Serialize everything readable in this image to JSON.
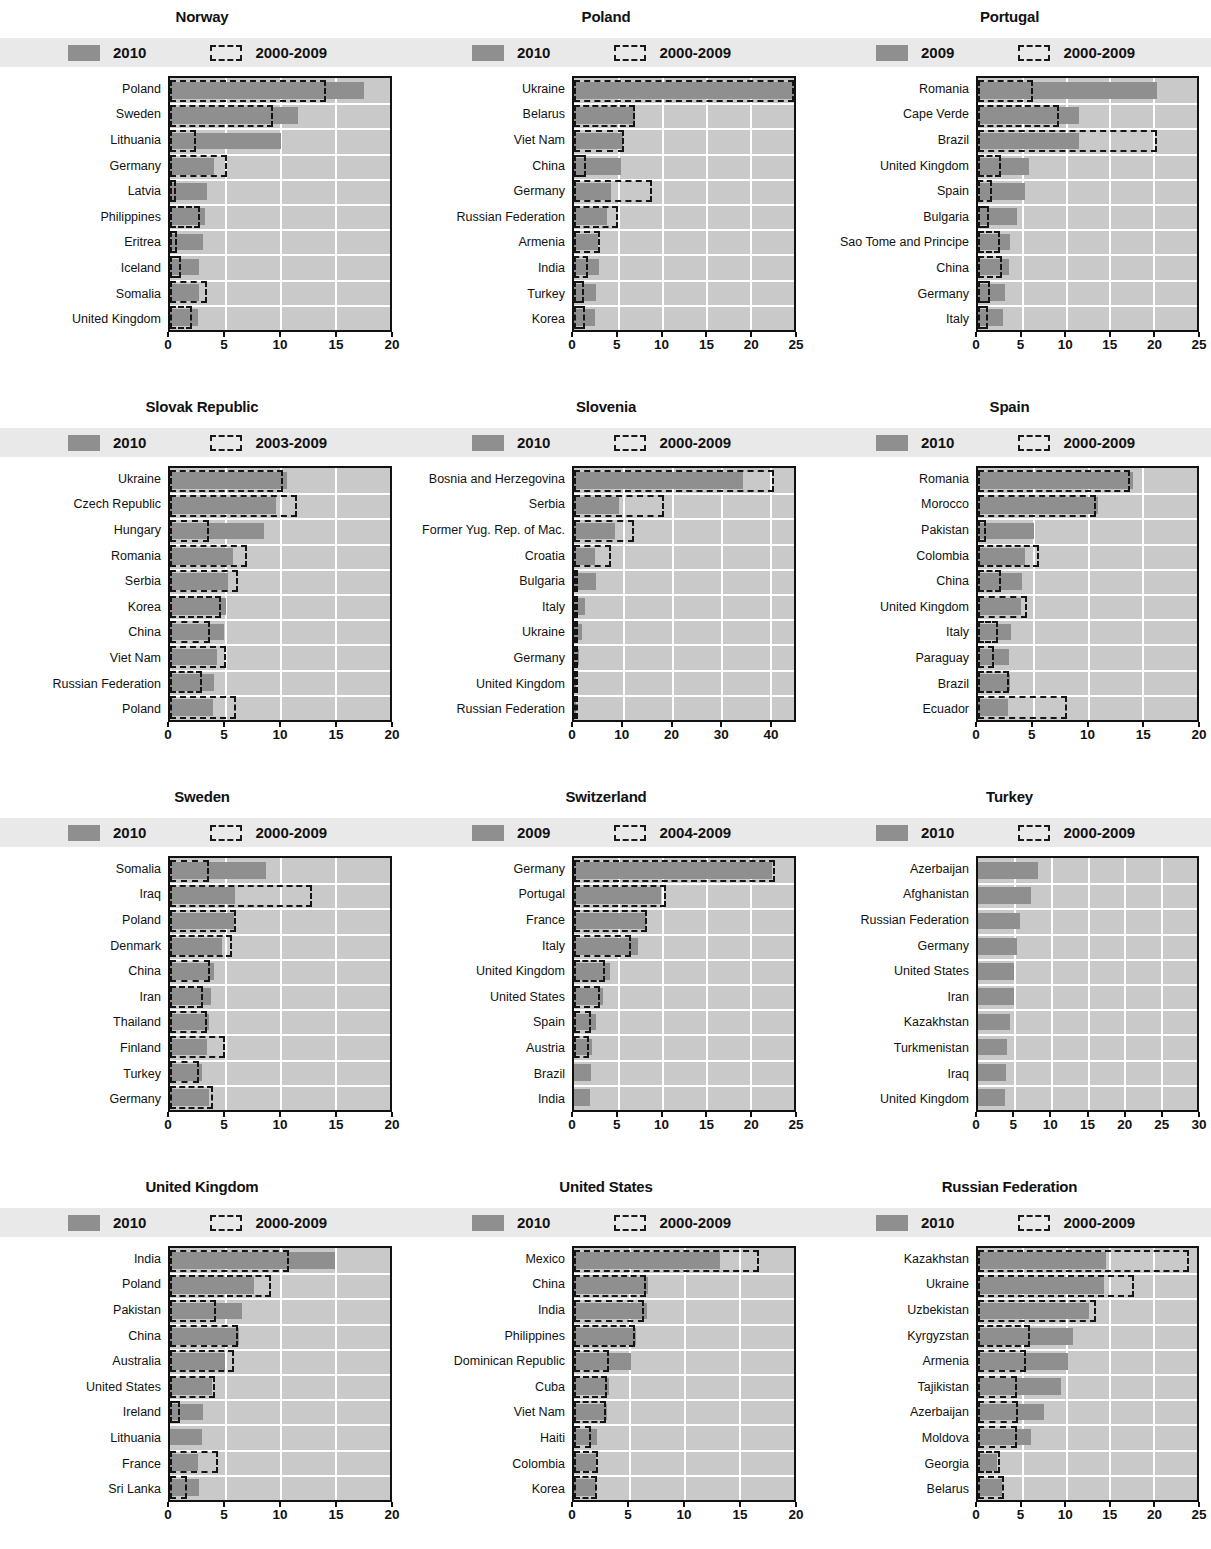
{
  "legend": {
    "series_solid_default": "2010",
    "series_dash_default": "2000-2009"
  },
  "chart_data": {
    "type": "bar",
    "xlabel": "",
    "ylabel": "",
    "orientation": "horizontal",
    "grid": true,
    "legend_position": "top",
    "panels": [
      {
        "title": "Norway",
        "legend": {
          "solid": "2010",
          "dash": "2000-2009"
        },
        "xlim": [
          0,
          20
        ],
        "ticks": [
          0,
          5,
          10,
          15,
          20
        ],
        "categories": [
          "Poland",
          "Sweden",
          "Lithuania",
          "Germany",
          "Latvia",
          "Philippines",
          "Eritrea",
          "Iceland",
          "Somalia",
          "United Kingdom"
        ],
        "series": [
          {
            "name": "2010",
            "values": [
              17.6,
              11.6,
              10.1,
              4.0,
              3.4,
              3.2,
              3.0,
              2.6,
              2.6,
              2.5
            ]
          },
          {
            "name": "2000-2009",
            "values": [
              14.2,
              9.4,
              2.4,
              5.2,
              0.5,
              2.7,
              0.6,
              1.0,
              3.4,
              2.0
            ]
          }
        ]
      },
      {
        "title": "Poland",
        "legend": {
          "solid": "2010",
          "dash": "2000-2009"
        },
        "xlim": [
          0,
          25
        ],
        "ticks": [
          0,
          5,
          10,
          15,
          20,
          25
        ],
        "categories": [
          "Ukraine",
          "Belarus",
          "Viet Nam",
          "China",
          "Germany",
          "Russian Federation",
          "Armenia",
          "India",
          "Turkey",
          "Korea"
        ],
        "series": [
          {
            "name": "2010",
            "values": [
              25.0,
              6.9,
              5.6,
              5.3,
              4.2,
              3.8,
              2.7,
              2.8,
              2.5,
              2.4
            ]
          },
          {
            "name": "2000-2009",
            "values": [
              25.0,
              6.9,
              5.7,
              1.4,
              8.9,
              5.0,
              3.0,
              1.6,
              1.1,
              1.2
            ]
          }
        ]
      },
      {
        "title": "Portugal",
        "legend": {
          "solid": "2009",
          "dash": "2000-2009"
        },
        "xlim": [
          0,
          25
        ],
        "ticks": [
          0,
          5,
          10,
          15,
          20,
          25
        ],
        "categories": [
          "Romania",
          "Cape Verde",
          "Brazil",
          "United Kingdom",
          "Spain",
          "Bulgaria",
          "Sao Tome and Principe",
          "China",
          "Germany",
          "Italy"
        ],
        "series": [
          {
            "name": "2009",
            "values": [
              20.4,
              11.5,
              11.5,
              5.8,
              5.4,
              4.4,
              3.6,
              3.5,
              3.1,
              2.9
            ]
          },
          {
            "name": "2000-2009",
            "values": [
              6.3,
              9.3,
              20.4,
              2.6,
              1.6,
              1.2,
              2.5,
              2.7,
              1.4,
              1.1
            ]
          }
        ]
      },
      {
        "title": "Slovak Republic",
        "legend": {
          "solid": "2010",
          "dash": "2003-2009"
        },
        "xlim": [
          0,
          20
        ],
        "ticks": [
          0,
          5,
          10,
          15,
          20
        ],
        "categories": [
          "Ukraine",
          "Czech Republic",
          "Hungary",
          "Romania",
          "Serbia",
          "Korea",
          "China",
          "Viet Nam",
          "Russian Federation",
          "Poland"
        ],
        "series": [
          {
            "name": "2010",
            "values": [
              10.6,
              9.6,
              8.5,
              5.7,
              5.3,
              5.1,
              4.9,
              4.3,
              4.0,
              3.9
            ]
          },
          {
            "name": "2003-2009",
            "values": [
              10.3,
              11.5,
              3.5,
              7.0,
              6.2,
              4.6,
              3.6,
              5.1,
              2.9,
              6.0
            ]
          }
        ]
      },
      {
        "title": "Slovenia",
        "legend": {
          "solid": "2010",
          "dash": "2000-2009"
        },
        "xlim": [
          0,
          45
        ],
        "ticks": [
          0,
          10,
          20,
          30,
          40
        ],
        "categories": [
          "Bosnia and Herzegovina",
          "Serbia",
          "Former Yug. Rep. of Mac.",
          "Croatia",
          "Bulgaria",
          "Italy",
          "Ukraine",
          "Germany",
          "United Kingdom",
          "Russian Federation"
        ],
        "series": [
          {
            "name": "2010",
            "values": [
              34.5,
              9.2,
              8.4,
              4.3,
              4.5,
              2.2,
              1.7,
              1.1,
              0.5,
              0.5
            ]
          },
          {
            "name": "2000-2009",
            "values": [
              41.0,
              18.5,
              12.3,
              7.5,
              0.4,
              0.3,
              0.8,
              0.3,
              0.3,
              0.6
            ]
          }
        ]
      },
      {
        "title": "Spain",
        "legend": {
          "solid": "2010",
          "dash": "2000-2009"
        },
        "xlim": [
          0,
          20
        ],
        "ticks": [
          0,
          5,
          10,
          15,
          20
        ],
        "categories": [
          "Romania",
          "Morocco",
          "Pakistan",
          "Colombia",
          "China",
          "United Kingdom",
          "Italy",
          "Paraguay",
          "Brazil",
          "Ecuador"
        ],
        "series": [
          {
            "name": "2010",
            "values": [
              14.2,
              11.0,
              5.1,
              4.3,
              4.0,
              3.9,
              3.0,
              2.8,
              2.9,
              2.7
            ]
          },
          {
            "name": "2000-2009",
            "values": [
              13.9,
              10.8,
              0.7,
              5.6,
              2.1,
              4.5,
              1.8,
              1.5,
              2.8,
              8.1
            ]
          }
        ]
      },
      {
        "title": "Sweden",
        "legend": {
          "solid": "2010",
          "dash": "2000-2009"
        },
        "xlim": [
          0,
          20
        ],
        "ticks": [
          0,
          5,
          10,
          15,
          20
        ],
        "categories": [
          "Somalia",
          "Iraq",
          "Poland",
          "Denmark",
          "China",
          "Iran",
          "Thailand",
          "Finland",
          "Turkey",
          "Germany"
        ],
        "series": [
          {
            "name": "2010",
            "values": [
              8.7,
              5.9,
              5.8,
              4.7,
              4.0,
              3.7,
              3.5,
              3.4,
              2.9,
              3.5
            ]
          },
          {
            "name": "2000-2009",
            "values": [
              3.5,
              12.9,
              6.0,
              5.6,
              3.6,
              3.0,
              3.4,
              5.0,
              2.6,
              3.9
            ]
          }
        ]
      },
      {
        "title": "Switzerland",
        "legend": {
          "solid": "2009",
          "dash": "2004-2009"
        },
        "xlim": [
          0,
          25
        ],
        "ticks": [
          0,
          5,
          10,
          15,
          20,
          25
        ],
        "categories": [
          "Germany",
          "Portugal",
          "France",
          "Italy",
          "United Kingdom",
          "United States",
          "Spain",
          "Austria",
          "Brazil",
          "India"
        ],
        "series": [
          {
            "name": "2009",
            "values": [
              22.5,
              9.9,
              8.2,
              7.3,
              4.1,
              3.3,
              2.5,
              2.1,
              1.9,
              1.8
            ]
          },
          {
            "name": "2004-2009",
            "values": [
              22.8,
              10.5,
              8.3,
              6.5,
              3.5,
              2.9,
              1.9,
              1.7,
              0.0,
              0.0
            ]
          }
        ]
      },
      {
        "title": "Turkey",
        "legend": {
          "solid": "2010",
          "dash": "2000-2009"
        },
        "xlim": [
          0,
          30
        ],
        "ticks": [
          0,
          5,
          10,
          15,
          20,
          25,
          30
        ],
        "categories": [
          "Azerbaijan",
          "Afghanistan",
          "Russian Federation",
          "Germany",
          "United States",
          "Iran",
          "Kazakhstan",
          "Turkmenistan",
          "Iraq",
          "United Kingdom"
        ],
        "series": [
          {
            "name": "2010",
            "values": [
              8.2,
              7.2,
              5.7,
              5.3,
              4.9,
              4.9,
              4.4,
              4.0,
              3.8,
              3.7
            ]
          },
          {
            "name": "2000-2009",
            "values": [
              0,
              0,
              0,
              0,
              0,
              0,
              0,
              0,
              0,
              0
            ]
          }
        ]
      },
      {
        "title": "United Kingdom",
        "legend": {
          "solid": "2010",
          "dash": "2000-2009"
        },
        "xlim": [
          0,
          20
        ],
        "ticks": [
          0,
          5,
          10,
          15,
          20
        ],
        "categories": [
          "India",
          "Poland",
          "Pakistan",
          "China",
          "Australia",
          "United States",
          "Ireland",
          "Lithuania",
          "France",
          "Sri Lanka"
        ],
        "series": [
          {
            "name": "2010",
            "values": [
              15.0,
              7.6,
              6.5,
              6.3,
              5.0,
              3.8,
              3.0,
              2.9,
              2.5,
              2.6
            ]
          },
          {
            "name": "2000-2009",
            "values": [
              10.8,
              9.2,
              4.2,
              6.2,
              5.8,
              4.1,
              0.9,
              0.0,
              4.4,
              1.5
            ]
          }
        ]
      },
      {
        "title": "United States",
        "legend": {
          "solid": "2010",
          "dash": "2000-2009"
        },
        "xlim": [
          0,
          20
        ],
        "ticks": [
          0,
          5,
          10,
          15,
          20
        ],
        "categories": [
          "Mexico",
          "China",
          "India",
          "Philippines",
          "Dominican Republic",
          "Cuba",
          "Viet Nam",
          "Haiti",
          "Colombia",
          "Korea"
        ],
        "series": [
          {
            "name": "2010",
            "values": [
              13.3,
              6.7,
              6.6,
              5.6,
              5.2,
              3.2,
              3.0,
              2.1,
              2.0,
              2.0
            ]
          },
          {
            "name": "2000-2009",
            "values": [
              16.8,
              6.5,
              6.4,
              5.5,
              3.2,
              3.0,
              2.9,
              1.5,
              2.2,
              2.1
            ]
          }
        ]
      },
      {
        "title": "Russian Federation",
        "legend": {
          "solid": "2010",
          "dash": "2000-2009"
        },
        "xlim": [
          0,
          25
        ],
        "ticks": [
          0,
          5,
          10,
          15,
          20,
          25
        ],
        "categories": [
          "Kazakhstan",
          "Ukraine",
          "Uzbekistan",
          "Kyrgyzstan",
          "Armenia",
          "Tajikistan",
          "Azerbaijan",
          "Moldova",
          "Georgia",
          "Belarus"
        ],
        "series": [
          {
            "name": "2010",
            "values": [
              14.6,
              14.4,
              12.7,
              10.8,
              10.3,
              9.5,
              7.5,
              6.1,
              2.2,
              2.7
            ]
          },
          {
            "name": "2000-2009",
            "values": [
              24.1,
              17.8,
              13.5,
              5.9,
              5.5,
              4.4,
              4.6,
              4.5,
              2.5,
              3.0
            ]
          }
        ]
      }
    ]
  }
}
